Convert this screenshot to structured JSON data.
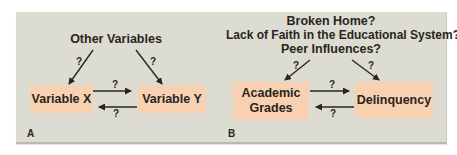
{
  "colors": {
    "panel_background": "#dcdcd2",
    "box_fill": "#f8d1b2",
    "text": "#2a2520",
    "arrow": "#2a2520"
  },
  "panel_a": {
    "label": "A",
    "top_node": "Other Variables",
    "left_node": "Variable X",
    "right_node": "Variable Y",
    "edges": [
      {
        "from": "Other Variables",
        "to": "Variable X",
        "label": "?"
      },
      {
        "from": "Other Variables",
        "to": "Variable Y",
        "label": "?"
      },
      {
        "from": "Variable X",
        "to": "Variable Y",
        "label": "?"
      },
      {
        "from": "Variable Y",
        "to": "Variable X",
        "label": "?"
      }
    ]
  },
  "panel_b": {
    "label": "B",
    "top_lines": [
      "Broken Home?",
      "Lack of Faith in the Educational System?",
      "Peer Influences?"
    ],
    "left_node_line1": "Academic",
    "left_node_line2": "Grades",
    "right_node": "Delinquency",
    "edges": [
      {
        "from": "Third variables",
        "to": "Academic Grades",
        "label": "?"
      },
      {
        "from": "Third variables",
        "to": "Delinquency",
        "label": "?"
      },
      {
        "from": "Academic Grades",
        "to": "Delinquency",
        "label": "?"
      },
      {
        "from": "Delinquency",
        "to": "Academic Grades",
        "label": "?"
      }
    ]
  },
  "question_mark": "?"
}
